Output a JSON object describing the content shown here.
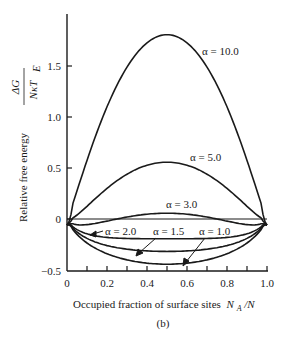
{
  "chart_data": {
    "type": "line",
    "title": "",
    "subtitle": "(b)",
    "xlabel": "Occupied fraction of surface sites N_A/N",
    "ylabel": "Relative free energy ΔG / NκT_E",
    "ylabel_prefix": "Relative free energy",
    "ylabel_fraction_num": "ΔG",
    "ylabel_fraction_den": "NκT",
    "ylabel_fraction_den_sub": "E",
    "xlim": [
      0,
      1.0
    ],
    "ylim": [
      -0.5,
      1.9
    ],
    "x_ticks": [
      "0",
      "0.2",
      "0.4",
      "0.6",
      "0.8",
      "1.0"
    ],
    "x_minor_step": 0.1,
    "y_ticks": [
      "−0.5",
      "0",
      "0.5",
      "1.0",
      "1.5"
    ],
    "grid": false,
    "legend": "inline labels",
    "series": [
      {
        "name": "α = 10.0",
        "alpha": 10.0,
        "peak_value_at_0.5": 1.81
      },
      {
        "name": "α = 5.0",
        "alpha": 5.0,
        "peak_value_at_0.5": 0.56
      },
      {
        "name": "α = 3.0",
        "alpha": 3.0,
        "peak_value_at_0.5": 0.06
      },
      {
        "name": "α = 2.0",
        "alpha": 2.0,
        "peak_value_at_0.5": -0.19
      },
      {
        "name": "α = 1.5",
        "alpha": 1.5,
        "peak_value_at_0.5": -0.32
      },
      {
        "name": "α = 1.0",
        "alpha": 1.0,
        "peak_value_at_0.5": -0.44
      }
    ],
    "x": [
      0,
      0.05,
      0.1,
      0.2,
      0.3,
      0.4,
      0.5,
      0.6,
      0.7,
      0.8,
      0.9,
      0.95,
      1.0
    ],
    "annotations": [
      "α = 10.0",
      "α = 5.0",
      "α = 3.0",
      "α = 2.0",
      "α = 1.5",
      "α = 1.0"
    ],
    "reference_line": {
      "y": 0,
      "description": "horizontal zero line"
    }
  },
  "labels": {
    "xlabel_text": "Occupied fraction of surface sites",
    "xlabel_symbol": "N",
    "xlabel_symbol_sub": "A",
    "xlabel_tail": "/N",
    "panel": "(b)",
    "alpha_10": "α = 10.0",
    "alpha_5": "α = 5.0",
    "alpha_3": "α = 3.0",
    "alpha_2": "α = 2.0",
    "alpha_15": "α = 1.5",
    "alpha_1": "α = 1.0",
    "ytick_15": "1.5",
    "ytick_10": "1.0",
    "ytick_05": "0.5",
    "ytick_0": "0",
    "ytick_m05": "−0.5",
    "xtick_0": "0",
    "xtick_02": "0.2",
    "xtick_04": "0.4",
    "xtick_06": "0.6",
    "xtick_08": "0.8",
    "xtick_10": "1.0"
  }
}
